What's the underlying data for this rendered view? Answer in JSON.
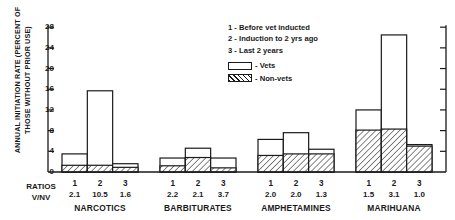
{
  "chart_data": {
    "type": "bar",
    "title": "",
    "ylabel": "ANNUAL INITIATION RATE (PERCENT OF THOSE WITHOUT PRIOR USE)",
    "ylabel_line1": "ANNUAL INITIATION RATE (PERCENT OF",
    "ylabel_line2": "THOSE WITHOUT PRIOR USE)",
    "xlabel": "",
    "ylim": [
      0,
      29
    ],
    "yticks": [
      0,
      4,
      8,
      12,
      16,
      20,
      24,
      28
    ],
    "ytick_labels": [
      "0",
      "4",
      "8",
      "12",
      "16",
      "20",
      "24",
      "28"
    ],
    "grid": false,
    "legend_position": "upper-center",
    "period_legend": [
      {
        "key": "1",
        "sep": "-",
        "label": "Before vet inducted"
      },
      {
        "key": "2",
        "sep": "-",
        "label": "Induction to 2 yrs ago"
      },
      {
        "key": "3",
        "sep": "-",
        "label": "Last 2 years"
      }
    ],
    "series_legend": [
      {
        "name": "Vets",
        "sep": "-",
        "fill": "open"
      },
      {
        "name": "Non-vets",
        "sep": "-",
        "fill": "hatched"
      }
    ],
    "series": [
      {
        "name": "Vets",
        "fill": "open",
        "values": [
          3.5,
          15.7,
          1.6,
          2.7,
          4.6,
          2.7,
          6.3,
          7.6,
          4.4,
          12.0,
          26.5,
          5.3
        ]
      },
      {
        "name": "Non-vets",
        "fill": "hatched",
        "values": [
          1.3,
          1.3,
          0.9,
          1.2,
          2.8,
          0.8,
          3.2,
          3.5,
          3.5,
          8.1,
          8.3,
          5.0
        ]
      }
    ],
    "groups": [
      {
        "name": "NARCOTICS",
        "bars": [
          {
            "num": "1",
            "ratio": "2.1",
            "vets": 3.5,
            "nonvets": 1.3
          },
          {
            "num": "2",
            "ratio": "10.5",
            "vets": 15.7,
            "nonvets": 1.3
          },
          {
            "num": "3",
            "ratio": "1.6",
            "vets": 1.6,
            "nonvets": 0.9
          }
        ]
      },
      {
        "name": "BARBITURATES",
        "bars": [
          {
            "num": "1",
            "ratio": "2.2",
            "vets": 2.7,
            "nonvets": 1.2
          },
          {
            "num": "2",
            "ratio": "2.1",
            "vets": 4.6,
            "nonvets": 2.8
          },
          {
            "num": "3",
            "ratio": "3.7",
            "vets": 2.7,
            "nonvets": 0.8
          }
        ]
      },
      {
        "name": "AMPHETAMINES",
        "bars": [
          {
            "num": "1",
            "ratio": "2.0",
            "vets": 6.3,
            "nonvets": 3.2
          },
          {
            "num": "2",
            "ratio": "2.0",
            "vets": 7.6,
            "nonvets": 3.5
          },
          {
            "num": "3",
            "ratio": "1.3",
            "vets": 4.4,
            "nonvets": 3.5
          }
        ]
      },
      {
        "name": "MARIHUANA",
        "bars": [
          {
            "num": "1",
            "ratio": "1.5",
            "vets": 12.0,
            "nonvets": 8.1
          },
          {
            "num": "2",
            "ratio": "3.1",
            "vets": 26.5,
            "nonvets": 8.3
          },
          {
            "num": "3",
            "ratio": "1.0",
            "vets": 5.3,
            "nonvets": 5.0
          }
        ]
      }
    ],
    "ratios_label_line1": "RATIOS",
    "ratios_label_line2": "V/NV",
    "colors": {
      "axis": "#1a1a1a",
      "bar_outline": "#1a1a1a",
      "hatch": "#1a1a1a",
      "background": "#ffffff"
    }
  }
}
